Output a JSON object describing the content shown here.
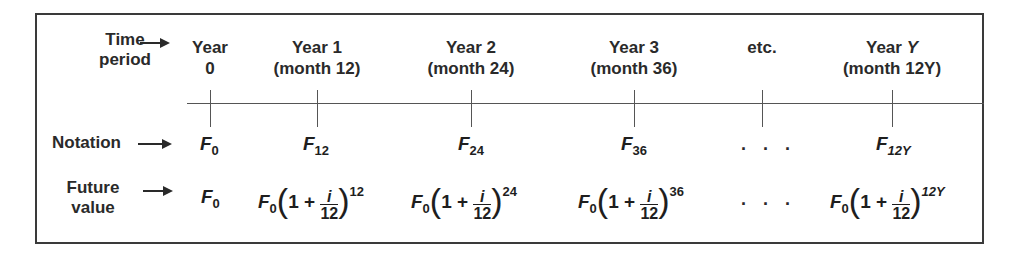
{
  "row_labels": {
    "time_period": [
      "Time",
      "period"
    ],
    "notation": "Notation",
    "future_value": [
      "Future",
      "value"
    ]
  },
  "columns": [
    {
      "year": "Year",
      "sub": "0",
      "notation_base": "F",
      "notation_sub": "0",
      "fv_base": "F",
      "fv_sub": "0",
      "fv_exp": ""
    },
    {
      "year": "Year 1",
      "sub": "(month 12)",
      "notation_base": "F",
      "notation_sub": "12",
      "fv_base": "F",
      "fv_sub": "0",
      "fv_exp": "12"
    },
    {
      "year": "Year 2",
      "sub": "(month 24)",
      "notation_base": "F",
      "notation_sub": "24",
      "fv_base": "F",
      "fv_sub": "0",
      "fv_exp": "24"
    },
    {
      "year": "Year 3",
      "sub": "(month 36)",
      "notation_base": "F",
      "notation_sub": "36",
      "fv_base": "F",
      "fv_sub": "0",
      "fv_exp": "36"
    },
    {
      "year": "etc.",
      "sub": "",
      "notation": ". . .",
      "fv": ". . ."
    },
    {
      "year_prefix": "Year ",
      "year_var": "Y",
      "sub": "(month 12Y)",
      "notation_base": "F",
      "notation_sub": "12Y",
      "fv_base": "F",
      "fv_sub": "0",
      "fv_exp": "12Y"
    }
  ],
  "formula": {
    "one_plus": "1 +",
    "num": "i",
    "den": "12",
    "lparen": "(",
    "rparen": ")"
  },
  "colors": {
    "line": "#555555",
    "text": "#1e1e1e",
    "border": "#3a3a3a"
  }
}
